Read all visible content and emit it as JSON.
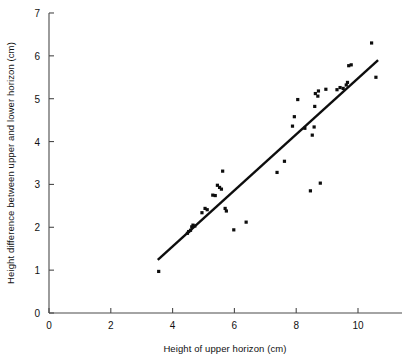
{
  "chart_data": {
    "type": "scatter",
    "title": "",
    "xlabel": "Height of upper horizon (cm)",
    "ylabel": "Height difference between upper and lower horizon (cm)",
    "xlim": [
      0,
      11.5
    ],
    "ylim": [
      0,
      7
    ],
    "xticks": [
      0,
      2,
      4,
      6,
      8,
      10
    ],
    "xticklabels": [
      "0",
      "2",
      "4",
      "6",
      "8",
      "10"
    ],
    "yticks": [
      0,
      1,
      2,
      3,
      4,
      5,
      6,
      7
    ],
    "yticklabels": [
      "0",
      "1",
      "2",
      "3",
      "4",
      "5",
      "6",
      "7"
    ],
    "grid": false,
    "legend": null,
    "marker": "square",
    "marker_color": "#0d0d0d",
    "marker_size": 3.2,
    "points": [
      {
        "x": 3.55,
        "y": 0.97
      },
      {
        "x": 4.48,
        "y": 1.86
      },
      {
        "x": 4.52,
        "y": 1.9
      },
      {
        "x": 4.58,
        "y": 1.93
      },
      {
        "x": 4.62,
        "y": 2.01
      },
      {
        "x": 4.66,
        "y": 2.05
      },
      {
        "x": 4.72,
        "y": 2.03
      },
      {
        "x": 4.95,
        "y": 2.34
      },
      {
        "x": 5.05,
        "y": 2.44
      },
      {
        "x": 5.12,
        "y": 2.41
      },
      {
        "x": 5.3,
        "y": 2.75
      },
      {
        "x": 5.38,
        "y": 2.74
      },
      {
        "x": 5.45,
        "y": 2.98
      },
      {
        "x": 5.52,
        "y": 2.93
      },
      {
        "x": 5.58,
        "y": 2.89
      },
      {
        "x": 5.62,
        "y": 3.31
      },
      {
        "x": 5.7,
        "y": 2.44
      },
      {
        "x": 5.74,
        "y": 2.38
      },
      {
        "x": 5.98,
        "y": 1.94
      },
      {
        "x": 6.38,
        "y": 2.12
      },
      {
        "x": 7.38,
        "y": 3.28
      },
      {
        "x": 7.62,
        "y": 3.54
      },
      {
        "x": 7.88,
        "y": 4.36
      },
      {
        "x": 7.94,
        "y": 4.58
      },
      {
        "x": 8.05,
        "y": 4.98
      },
      {
        "x": 8.28,
        "y": 4.31
      },
      {
        "x": 8.46,
        "y": 2.85
      },
      {
        "x": 8.52,
        "y": 4.15
      },
      {
        "x": 8.58,
        "y": 4.34
      },
      {
        "x": 8.6,
        "y": 4.82
      },
      {
        "x": 8.62,
        "y": 5.12
      },
      {
        "x": 8.7,
        "y": 5.06
      },
      {
        "x": 8.72,
        "y": 5.18
      },
      {
        "x": 8.78,
        "y": 3.03
      },
      {
        "x": 8.96,
        "y": 5.22
      },
      {
        "x": 9.32,
        "y": 5.21
      },
      {
        "x": 9.42,
        "y": 5.26
      },
      {
        "x": 9.52,
        "y": 5.24
      },
      {
        "x": 9.62,
        "y": 5.32
      },
      {
        "x": 9.66,
        "y": 5.38
      },
      {
        "x": 9.7,
        "y": 5.77
      },
      {
        "x": 9.78,
        "y": 5.79
      },
      {
        "x": 10.44,
        "y": 6.3
      },
      {
        "x": 10.58,
        "y": 5.5
      }
    ],
    "fit_line": {
      "type": "linear",
      "x_start": 3.52,
      "y_start": 1.24,
      "x_end": 10.65,
      "y_end": 5.9
    }
  }
}
